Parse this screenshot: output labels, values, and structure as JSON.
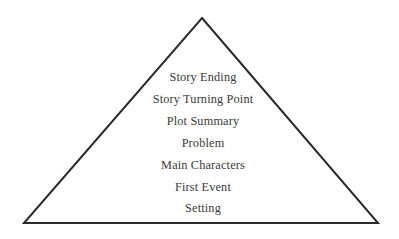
{
  "figure": {
    "name": "story-pyramid",
    "background_color": "#ffffff"
  },
  "pyramid": {
    "stroke_color": "#2b2b2b",
    "stroke_width": 2,
    "fill_color": "#ffffff",
    "apex": {
      "x": 202,
      "y": 18
    },
    "bottom_left": {
      "x": 24,
      "y": 223
    },
    "bottom_right": {
      "x": 378,
      "y": 223
    }
  },
  "labels": {
    "text_color": "#3a3a3a",
    "center_x": 203,
    "items": [
      {
        "label": "Story Ending",
        "y": 70
      },
      {
        "label": "Story Turning Point",
        "y": 92
      },
      {
        "label": "Plot Summary",
        "y": 114
      },
      {
        "label": "Problem",
        "y": 136
      },
      {
        "label": "Main Characters",
        "y": 158
      },
      {
        "label": "First Event",
        "y": 180
      },
      {
        "label": "Setting",
        "y": 201
      }
    ]
  }
}
